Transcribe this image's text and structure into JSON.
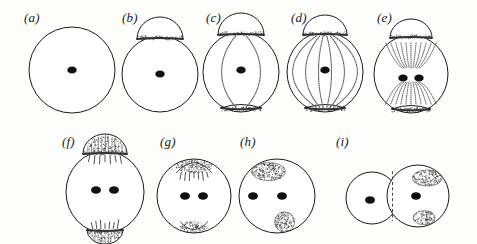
{
  "figure": {
    "type": "scientific-line-diagram",
    "background_color": "#fdfdfb",
    "ink_color": "#1a1a1a",
    "stipple_color": "#5d5d5d",
    "panel_count": 9,
    "rows": 2
  },
  "panels": [
    {
      "id": "a",
      "label": "(a)",
      "row": 1,
      "label_x": 24,
      "label_y": 10,
      "cell": {
        "cx": 72,
        "cy": 70,
        "rx": 43,
        "ry": 43
      },
      "nuclei": [
        {
          "cx": 72,
          "cy": 70,
          "r": 4.2
        }
      ],
      "caps": [],
      "meridians": 0,
      "fibers": "none",
      "cleavage": false
    },
    {
      "id": "b",
      "label": "(b)",
      "row": 1,
      "label_x": 122,
      "label_y": 10,
      "cell": {
        "cx": 160,
        "cy": 74,
        "rx": 38,
        "ry": 38
      },
      "nuclei": [
        {
          "cx": 160,
          "cy": 74,
          "r": 4.2
        }
      ],
      "caps": [
        {
          "position": "top",
          "style": "dome",
          "width": 46,
          "height": 22
        }
      ],
      "meridians": 0,
      "fibers": "none",
      "cleavage": false
    },
    {
      "id": "c",
      "label": "(c)",
      "row": 1,
      "label_x": 206,
      "label_y": 10,
      "cell": {
        "cx": 241,
        "cy": 72,
        "rx": 38,
        "ry": 40
      },
      "nuclei": [
        {
          "cx": 241,
          "cy": 70,
          "r": 4.2
        }
      ],
      "caps": [
        {
          "position": "top",
          "style": "dome",
          "width": 46,
          "height": 22
        },
        {
          "position": "bottom",
          "style": "band",
          "width": 40,
          "height": 10
        }
      ],
      "meridians": 2,
      "fibers": "meridional",
      "cleavage": false
    },
    {
      "id": "d",
      "label": "(d)",
      "row": 1,
      "label_x": 291,
      "label_y": 10,
      "cell": {
        "cx": 325,
        "cy": 72,
        "rx": 38,
        "ry": 40
      },
      "nuclei": [
        {
          "cx": 325,
          "cy": 70,
          "r": 4.2
        }
      ],
      "caps": [
        {
          "position": "top",
          "style": "dome",
          "width": 44,
          "height": 20
        },
        {
          "position": "bottom",
          "style": "band",
          "width": 40,
          "height": 10
        }
      ],
      "meridians": 6,
      "fibers": "meridional-dense",
      "cleavage": false
    },
    {
      "id": "e",
      "label": "(e)",
      "row": 1,
      "label_x": 377,
      "label_y": 10,
      "cell": {
        "cx": 411,
        "cy": 74,
        "rx": 37,
        "ry": 39
      },
      "nuclei": [
        {
          "cx": 403,
          "cy": 78,
          "r": 4.2
        },
        {
          "cx": 419,
          "cy": 78,
          "r": 4.2
        }
      ],
      "caps": [
        {
          "position": "top",
          "style": "dome",
          "width": 42,
          "height": 19
        },
        {
          "position": "bottom",
          "style": "band",
          "width": 38,
          "height": 10
        }
      ],
      "meridians": 0,
      "fibers": "radiating-astral",
      "cleavage": false
    },
    {
      "id": "f",
      "label": "(f)",
      "row": 2,
      "label_x": 62,
      "label_y": 134,
      "cell": {
        "cx": 105,
        "cy": 192,
        "rx": 39,
        "ry": 41
      },
      "nuclei": [
        {
          "cx": 96,
          "cy": 190,
          "r": 4.4
        },
        {
          "cx": 114,
          "cy": 190,
          "r": 4.4
        }
      ],
      "caps": [
        {
          "position": "top",
          "style": "hatched-dome",
          "width": 44,
          "height": 20
        },
        {
          "position": "bottom",
          "style": "hatched-dome",
          "width": 36,
          "height": 14
        }
      ],
      "meridians": 0,
      "fibers": "short-tufts",
      "cleavage": false
    },
    {
      "id": "g",
      "label": "(g)",
      "row": 2,
      "label_x": 160,
      "label_y": 134,
      "cell": {
        "cx": 194,
        "cy": 196,
        "rx": 37,
        "ry": 37
      },
      "nuclei": [
        {
          "cx": 185,
          "cy": 196,
          "r": 4.4
        },
        {
          "cx": 203,
          "cy": 196,
          "r": 4.4
        }
      ],
      "caps": [
        {
          "position": "top",
          "style": "stipple-patch",
          "width": 36,
          "height": 14
        },
        {
          "position": "bottom",
          "style": "stipple-patch",
          "width": 28,
          "height": 11
        }
      ],
      "meridians": 0,
      "fibers": "short-tufts",
      "cleavage": false
    },
    {
      "id": "h",
      "label": "(h)",
      "row": 2,
      "label_x": 240,
      "label_y": 134,
      "cell": {
        "cx": 277,
        "cy": 196,
        "rx": 38,
        "ry": 37
      },
      "nuclei": [
        {
          "cx": 253,
          "cy": 196,
          "r": 4.4
        },
        {
          "cx": 282,
          "cy": 196,
          "r": 4.4
        }
      ],
      "caps": [
        {
          "position": "top-left",
          "style": "stipple-blob",
          "width": 34,
          "height": 18
        },
        {
          "position": "bottom-right",
          "style": "stipple-blob",
          "width": 20,
          "height": 20
        }
      ],
      "meridians": 0,
      "fibers": "none",
      "cleavage": false
    },
    {
      "id": "i",
      "label": "(i)",
      "row": 2,
      "label_x": 336,
      "label_y": 134,
      "cells": [
        {
          "cx": 372,
          "cy": 198,
          "rx": 26,
          "ry": 26
        },
        {
          "cx": 418,
          "cy": 196,
          "rx": 31,
          "ry": 31
        }
      ],
      "nuclei": [
        {
          "cx": 370,
          "cy": 200,
          "r": 4.4
        },
        {
          "cx": 416,
          "cy": 196,
          "r": 4.4
        }
      ],
      "caps": [
        {
          "position": "top-right",
          "style": "stipple-blob",
          "width": 30,
          "height": 16
        },
        {
          "position": "bottom-right",
          "style": "stipple-blob",
          "width": 22,
          "height": 14
        }
      ],
      "meridians": 0,
      "fibers": "none",
      "cleavage": true
    }
  ]
}
